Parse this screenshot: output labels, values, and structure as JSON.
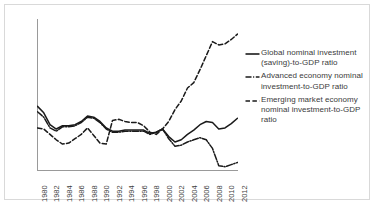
{
  "chart_data": {
    "type": "line",
    "title": "",
    "xlabel": "",
    "ylabel": "",
    "xlim": [
      1980,
      2012
    ],
    "ylim": [
      19,
      33
    ],
    "ytick_labels": [
      "19",
      "21",
      "23",
      "25",
      "27",
      "29",
      "31",
      "33"
    ],
    "yticks": [
      19,
      21,
      23,
      25,
      27,
      29,
      31,
      33
    ],
    "xtick_labels": [
      "1980",
      "1982",
      "1984",
      "1986",
      "1988",
      "1990",
      "1992",
      "1994",
      "1996",
      "1998",
      "2000",
      "2002",
      "2004",
      "2006",
      "2008",
      "2010",
      "2012"
    ],
    "xticks": [
      1980,
      1982,
      1984,
      1986,
      1988,
      1990,
      1992,
      1994,
      1996,
      1998,
      2000,
      2002,
      2004,
      2006,
      2008,
      2010,
      2012
    ],
    "grid": false,
    "legend_position": "right",
    "x": [
      1980,
      1981,
      1982,
      1983,
      1984,
      1985,
      1986,
      1987,
      1988,
      1989,
      1990,
      1991,
      1992,
      1993,
      1994,
      1995,
      1996,
      1997,
      1998,
      1999,
      2000,
      2001,
      2002,
      2003,
      2004,
      2005,
      2006,
      2007,
      2008,
      2009,
      2010,
      2011,
      2012
    ],
    "series": [
      {
        "name": "Global nominal investment (saving)-to-GDP ratio",
        "style": "solid",
        "color": "#1a1a1a",
        "values": [
          24.9,
          24.3,
          23.2,
          22.8,
          23.1,
          23.1,
          23.2,
          23.5,
          24.0,
          23.9,
          23.5,
          22.9,
          22.6,
          22.6,
          22.7,
          22.7,
          22.7,
          22.7,
          22.4,
          22.5,
          22.8,
          22.1,
          21.6,
          21.8,
          22.3,
          22.7,
          23.2,
          23.5,
          23.4,
          22.8,
          22.9,
          23.3,
          23.8
        ]
      },
      {
        "name": "Advanced economy nominal investment-to-GDP ratio",
        "style": "dashdot",
        "color": "#1a1a1a",
        "values": [
          24.4,
          23.9,
          22.9,
          22.6,
          23.0,
          23.0,
          23.1,
          23.4,
          23.9,
          23.8,
          23.4,
          22.8,
          22.5,
          22.5,
          22.6,
          22.6,
          22.6,
          22.6,
          22.3,
          22.5,
          22.8,
          21.9,
          21.2,
          21.3,
          21.6,
          21.8,
          22.0,
          21.8,
          21.0,
          19.4,
          19.3,
          19.5,
          19.7
        ]
      },
      {
        "name": "Emerging market economy nominal investment-to-GDP ratio",
        "style": "dashed",
        "color": "#1a1a1a",
        "values": [
          22.9,
          22.8,
          22.3,
          21.8,
          21.4,
          21.5,
          21.9,
          22.3,
          22.9,
          22.2,
          21.5,
          21.4,
          23.6,
          23.7,
          23.5,
          23.4,
          23.4,
          23.1,
          22.5,
          22.3,
          22.8,
          23.5,
          24.6,
          25.4,
          26.6,
          27.1,
          28.3,
          29.6,
          30.9,
          30.6,
          30.7,
          31.1,
          31.6
        ]
      }
    ]
  },
  "legend": {
    "entries": [
      {
        "label": "Global nominal investment (saving)-to-GDP ratio",
        "style": "solid"
      },
      {
        "label": "Advanced economy nominal investment-to-GDP ratio",
        "style": "dashdot"
      },
      {
        "label": "Emerging market economy nominal investment-to-GDP ratio",
        "style": "dashed"
      }
    ]
  }
}
